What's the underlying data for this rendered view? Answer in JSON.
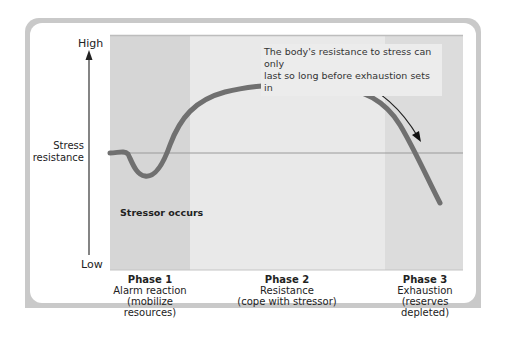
{
  "diagram": {
    "y_axis": {
      "high_label": "High",
      "low_label": "Low",
      "title_line1": "Stress",
      "title_line2": "resistance"
    },
    "annotation": {
      "line1": "The body's resistance to stress can only",
      "line2": "last so long before exhaustion sets in"
    },
    "event_label": "Stressor occurs",
    "phases": [
      {
        "title": "Phase 1",
        "line1": "Alarm reaction",
        "line2": "(mobilize",
        "line3": "resources)"
      },
      {
        "title": "Phase 2",
        "line1": "Resistance",
        "line2": "(cope with stressor)",
        "line3": ""
      },
      {
        "title": "Phase 3",
        "line1": "Exhaustion",
        "line2": "(reserves",
        "line3": "depleted)"
      }
    ],
    "colors": {
      "phase1_band": "#d6d6d6",
      "phase2_band": "#e8e8e8",
      "phase3_band": "#dcdcdc",
      "curve": "#6f6f6f",
      "baseline": "#9a9a9a",
      "frame": "#c9c9c9"
    }
  }
}
